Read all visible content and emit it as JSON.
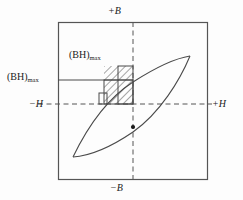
{
  "figure": {
    "type": "hysteresis-loop-diagram",
    "frame": {
      "x": 58,
      "y": 22,
      "width": 150,
      "height": 158,
      "stroke": "#555555"
    },
    "colors": {
      "frame": "#555555",
      "axis_dashed": "#555555",
      "curve": "#4a4a4a",
      "hatch": "#3a3a3a",
      "rect": "#4a4a4a",
      "text": "#1a1a1a",
      "background": "#fdfdfd"
    },
    "axes": {
      "vertical": {
        "x": 133,
        "y1": 22,
        "y2": 180,
        "style": "dashed"
      },
      "horizontal": {
        "y": 104,
        "x1": 38,
        "x2": 212,
        "style": "dashed"
      }
    },
    "labels": {
      "top_b": "+B",
      "bottom_b": "−B",
      "left_h": "−H",
      "right_h": "+H",
      "bh_max_inner_base": "(BH)",
      "bh_max_inner_sub": "max",
      "bh_max_outer_base": "(BH)",
      "bh_max_outer_sub": "max"
    },
    "marker_dot": {
      "cx": 133,
      "cy": 127,
      "r": 2.1
    },
    "leader_line": {
      "x1": 58,
      "y1": 80,
      "x2": 133,
      "y2": 80
    },
    "rectangles": [
      {
        "name": "tall-narrow-rect",
        "x": 118,
        "y": 66,
        "width": 15,
        "height": 38
      },
      {
        "name": "wide-short-rect",
        "x": 104,
        "y": 80,
        "width": 29,
        "height": 24
      },
      {
        "name": "small-corner-rect",
        "x": 99,
        "y": 93,
        "width": 8,
        "height": 11
      }
    ],
    "hatched_region": {
      "x": 104,
      "y": 66,
      "width": 29,
      "height": 38
    },
    "loop": {
      "upper_curve": "M 73,157 C 86,130 105,100 133,82 C 158,66 177,58 190,56",
      "lower_curve": "M 190,56 C 180,80 160,113 133,132 C 108,149 88,156 73,157"
    }
  }
}
